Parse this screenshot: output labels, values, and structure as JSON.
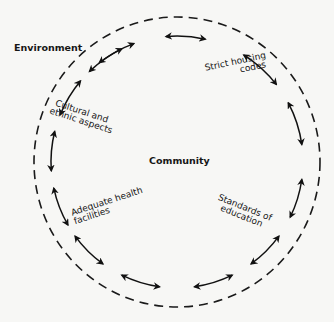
{
  "diagram": {
    "outer_label": "Environment",
    "center_label": "Community",
    "boundary": {
      "style": "dashed-circle",
      "color": "#1a1a1a"
    },
    "factors": [
      {
        "id": "housing",
        "lines": [
          "Strict housing",
          "codes"
        ]
      },
      {
        "id": "education",
        "lines": [
          "Standards of",
          "education"
        ]
      },
      {
        "id": "health",
        "lines": [
          "Adequate health",
          "facilities"
        ]
      },
      {
        "id": "culture",
        "lines": [
          "Cultural and",
          "ethnic aspects"
        ]
      }
    ],
    "connector": {
      "type": "double-headed-curved-arrow",
      "count": 14,
      "color": "#111111"
    }
  }
}
